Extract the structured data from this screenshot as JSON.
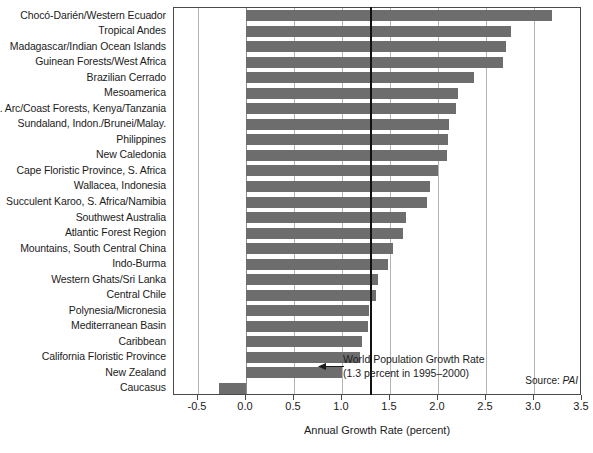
{
  "chart_data": {
    "type": "bar",
    "orientation": "horizontal",
    "title": "",
    "xlabel": "Annual Growth Rate (percent)",
    "ylabel": "",
    "xlim": [
      -0.75,
      3.5
    ],
    "xticks": [
      "-0.5",
      "0.0",
      "0.5",
      "1.0",
      "1.5",
      "2.0",
      "2.5",
      "3.0",
      "3.5"
    ],
    "xtick_values": [
      -0.5,
      0.0,
      0.5,
      1.0,
      1.5,
      2.0,
      2.5,
      3.0,
      3.5
    ],
    "grid": "vertical",
    "legend": "none",
    "bar_color": "#6d6d6d",
    "categories": [
      "Chocó-Darién/Western Ecuador",
      "Tropical Andes",
      "Madagascar/Indian Ocean Islands",
      "Guinean Forests/West Africa",
      "Brazilian Cerrado",
      "Mesoamerica",
      "E. Arc/Coast Forests, Kenya/Tanzania",
      "Sundaland, Indon./Brunei/Malay.",
      "Philippines",
      "New Caledonia",
      "Cape Floristic Province, S. Africa",
      "Wallacea, Indonesia",
      "Succulent Karoo, S. Africa/Namibia",
      "Southwest Australia",
      "Atlantic Forest Region",
      "Mountains, South Central China",
      "Indo-Burma",
      "Western Ghats/Sri Lanka",
      "Central Chile",
      "Polynesia/Micronesia",
      "Mediterranean Basin",
      "Caribbean",
      "California Floristic Province",
      "New Zealand",
      "Caucasus"
    ],
    "values": [
      3.19,
      2.76,
      2.71,
      2.68,
      2.38,
      2.21,
      2.19,
      2.11,
      2.1,
      2.09,
      2.0,
      1.92,
      1.89,
      1.67,
      1.64,
      1.53,
      1.48,
      1.38,
      1.35,
      1.28,
      1.27,
      1.21,
      1.19,
      1.0,
      -0.28
    ],
    "threshold": {
      "value": 1.3,
      "label_line1": "World Population Growth Rate",
      "label_line2": "(1.3 percent in 1995–2000)"
    },
    "source_prefix": "Source: ",
    "source_name": "PAI"
  }
}
